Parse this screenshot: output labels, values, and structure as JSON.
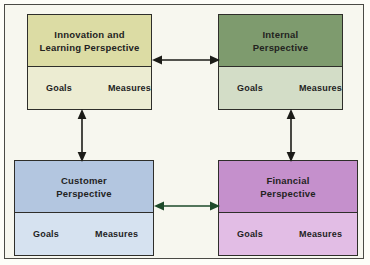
{
  "diagram": {
    "background_color": "#f7f7ef",
    "frame_border_color": "#4a4a45",
    "boxes": [
      {
        "id": "innovation",
        "title_lines": [
          "Innovation and",
          "Learning Perspective"
        ],
        "header_color": "#dcdca4",
        "body_color": "#ececd2",
        "columns": [
          "Goals",
          "Measures"
        ]
      },
      {
        "id": "internal",
        "title_lines": [
          "Internal",
          "Perspective"
        ],
        "header_color": "#7e9b6e",
        "body_color": "#d3ddc7",
        "columns": [
          "Goals",
          "Measures"
        ]
      },
      {
        "id": "customer",
        "title_lines": [
          "Customer",
          "Perspective"
        ],
        "header_color": "#b3c6e0",
        "body_color": "#d6e2f0",
        "columns": [
          "Goals",
          "Measures"
        ]
      },
      {
        "id": "financial",
        "title_lines": [
          "Financial",
          "Perspective"
        ],
        "header_color": "#c590cc",
        "body_color": "#e2bde5",
        "columns": [
          "Goals",
          "Measures"
        ]
      }
    ],
    "connectors": [
      {
        "id": "top-horizontal",
        "from": "innovation",
        "to": "internal",
        "orientation": "horizontal",
        "heads": "both",
        "color": "#1c1c18"
      },
      {
        "id": "bottom-horizontal",
        "from": "customer",
        "to": "financial",
        "orientation": "horizontal",
        "heads": "both",
        "color": "#1d4a2a"
      },
      {
        "id": "left-vertical",
        "from": "innovation",
        "to": "customer",
        "orientation": "vertical",
        "heads": "both",
        "color": "#1c1c18"
      },
      {
        "id": "right-vertical",
        "from": "internal",
        "to": "financial",
        "orientation": "vertical",
        "heads": "both",
        "color": "#1c1c18"
      }
    ]
  }
}
